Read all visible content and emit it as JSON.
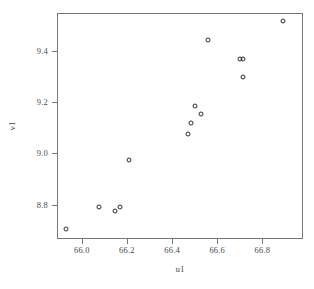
{
  "chart_data": {
    "type": "scatter",
    "title": "",
    "xlabel": "u1",
    "ylabel": "v1",
    "xlim": [
      65.89,
      66.98
    ],
    "ylim": [
      8.665,
      9.55
    ],
    "xticks": [
      66.0,
      66.2,
      66.4,
      66.6,
      66.8
    ],
    "xticklabels": [
      "66.0",
      "66.2",
      "66.4",
      "66.6",
      "66.8"
    ],
    "yticks": [
      8.8,
      9.0,
      9.2,
      9.4
    ],
    "yticklabels": [
      "8.8",
      "9.0",
      "9.2",
      "9.4"
    ],
    "grid": false,
    "legend": null,
    "marker": "open-circle",
    "marker_color": "#2b2b2b",
    "frame_color": "#777777",
    "background": "#ffffff",
    "points": [
      {
        "x": 65.93,
        "y": 8.705
      },
      {
        "x": 66.075,
        "y": 8.79
      },
      {
        "x": 66.145,
        "y": 8.775
      },
      {
        "x": 66.17,
        "y": 8.79
      },
      {
        "x": 66.21,
        "y": 8.975
      },
      {
        "x": 66.47,
        "y": 9.075
      },
      {
        "x": 66.485,
        "y": 9.12
      },
      {
        "x": 66.5,
        "y": 9.185
      },
      {
        "x": 66.53,
        "y": 9.155
      },
      {
        "x": 66.56,
        "y": 9.445
      },
      {
        "x": 66.7,
        "y": 9.37
      },
      {
        "x": 66.715,
        "y": 9.37
      },
      {
        "x": 66.715,
        "y": 9.3
      },
      {
        "x": 66.89,
        "y": 9.52
      }
    ]
  }
}
